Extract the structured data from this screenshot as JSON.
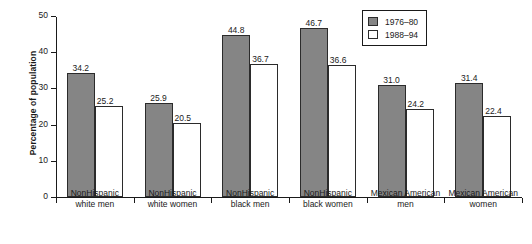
{
  "chart_data": {
    "type": "bar",
    "title": "",
    "xlabel": "",
    "ylabel": "Percentage of population",
    "ylim": [
      0,
      50
    ],
    "yticks": [
      0,
      10,
      20,
      30,
      40,
      50
    ],
    "ytick_labels": [
      "0",
      "10",
      "20",
      "30",
      "40",
      "50"
    ],
    "grid": false,
    "legend_position": "top-right",
    "categories": [
      "NonHispanic white men",
      "NonHispanic white women",
      "NonHispanic black men",
      "NonHispanic black women",
      "Mexican American men",
      "Mexican American women"
    ],
    "category_lines": [
      [
        "NonHispanic",
        "white men"
      ],
      [
        "NonHispanic",
        "white women"
      ],
      [
        "NonHispanic",
        "black men"
      ],
      [
        "NonHispanic",
        "black women"
      ],
      [
        "Mexican American",
        "men"
      ],
      [
        "Mexican American",
        "women"
      ]
    ],
    "series": [
      {
        "name": "1976–80",
        "style": "filled",
        "color": "#858585",
        "values": [
          34.2,
          25.9,
          44.8,
          46.7,
          31.0,
          31.4
        ],
        "labels": [
          "34.2",
          "25.9",
          "44.8",
          "46.7",
          "31.0",
          "31.4"
        ]
      },
      {
        "name": "1988–94",
        "style": "hollow",
        "color": "#ffffff",
        "values": [
          25.2,
          20.5,
          36.7,
          36.6,
          24.2,
          22.4
        ],
        "labels": [
          "25.2",
          "20.5",
          "36.7",
          "36.6",
          "24.2",
          "22.4"
        ]
      }
    ]
  },
  "legend": {
    "items": [
      {
        "label": "1976–80",
        "style": "filled"
      },
      {
        "label": "1988–94",
        "style": "hollow"
      }
    ]
  }
}
